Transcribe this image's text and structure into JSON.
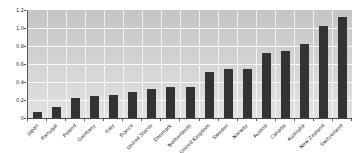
{
  "chart_data": {
    "type": "bar",
    "title": "",
    "categories": [
      "Japan",
      "Portugal",
      "Poland",
      "Germany",
      "Italy",
      "France",
      "United States",
      "Denmark",
      "Netherlands",
      "United Kingdom",
      "Sweden",
      "Norway",
      "Austria",
      "Canada",
      "Australia",
      "New Zealand",
      "Switzerland"
    ],
    "values": [
      0.07,
      0.12,
      0.22,
      0.24,
      0.26,
      0.29,
      0.32,
      0.35,
      0.35,
      0.51,
      0.55,
      0.55,
      0.72,
      0.74,
      0.82,
      1.02,
      1.12
    ],
    "xlabel": "",
    "ylabel": "",
    "ylim": [
      0,
      1.2
    ],
    "y_ticks": [
      {
        "label": "1.2",
        "value": 1.2
      },
      {
        "label": "1.0",
        "value": 1.0
      },
      {
        "label": "0.8",
        "value": 0.8
      },
      {
        "label": "0.6",
        "value": 0.6
      },
      {
        "label": "0.4",
        "value": 0.4
      },
      {
        "label": "0.2",
        "value": 0.2
      },
      {
        "label": "0",
        "value": 0
      }
    ],
    "grid": true,
    "legend_position": "none",
    "colors": {
      "bar": "#333333",
      "plot_bg_top": "#c5c5c5",
      "plot_bg_bottom": "#e2e2e2",
      "gridline": "#ffffff",
      "axis": "#555555",
      "tick_text": "#222222"
    }
  }
}
